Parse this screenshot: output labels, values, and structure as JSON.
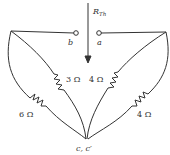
{
  "diagram": {
    "arrow_label": "R",
    "arrow_label_sub": "Th",
    "terminals": {
      "a": "a",
      "b": "b",
      "bottom": "c, c′"
    },
    "resistors": [
      {
        "id": "left-outer",
        "label": "6 Ω"
      },
      {
        "id": "left-inner",
        "label": "3 Ω"
      },
      {
        "id": "right-inner",
        "label": "4 Ω"
      },
      {
        "id": "right-outer",
        "label": "4 Ω"
      }
    ]
  }
}
